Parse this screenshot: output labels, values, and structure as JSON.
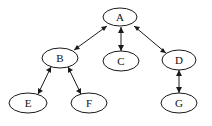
{
  "diagram": {
    "background_color": "#ffffff",
    "node_fill_color": "#ffffff",
    "node_stroke_color": "#1a1a1a",
    "edge_color": "#1a1a1a",
    "label_color": "#111111",
    "nodes": [
      {
        "id": "A",
        "label": "A",
        "cx": 120,
        "cy": 17,
        "rx": 17,
        "ry": 9
      },
      {
        "id": "B",
        "label": "B",
        "cx": 60,
        "cy": 58,
        "rx": 18,
        "ry": 10
      },
      {
        "id": "C",
        "label": "C",
        "cx": 121,
        "cy": 61,
        "rx": 18,
        "ry": 10
      },
      {
        "id": "D",
        "label": "D",
        "cx": 179,
        "cy": 60,
        "rx": 17,
        "ry": 10
      },
      {
        "id": "E",
        "label": "E",
        "cx": 28,
        "cy": 103,
        "rx": 19,
        "ry": 10
      },
      {
        "id": "F",
        "label": "F",
        "cx": 89,
        "cy": 103,
        "rx": 18,
        "ry": 10
      },
      {
        "id": "G",
        "label": "G",
        "cx": 179,
        "cy": 103,
        "rx": 18,
        "ry": 10
      }
    ],
    "edges": [
      {
        "id": "edge-a-b",
        "from": "A",
        "to": "B",
        "arrow_start": true,
        "arrow_end": true
      },
      {
        "id": "edge-a-c",
        "from": "A",
        "to": "C",
        "arrow_start": true,
        "arrow_end": true
      },
      {
        "id": "edge-a-d",
        "from": "A",
        "to": "D",
        "arrow_start": true,
        "arrow_end": true
      },
      {
        "id": "edge-b-e",
        "from": "B",
        "to": "E",
        "arrow_start": true,
        "arrow_end": true
      },
      {
        "id": "edge-b-f",
        "from": "B",
        "to": "F",
        "arrow_start": true,
        "arrow_end": true
      },
      {
        "id": "edge-d-g",
        "from": "D",
        "to": "G",
        "arrow_start": true,
        "arrow_end": true
      }
    ]
  }
}
